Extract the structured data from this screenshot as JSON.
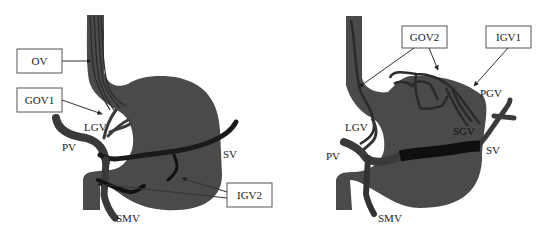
{
  "colors": {
    "organ": "#4a4a4a",
    "vessel": "#333333",
    "vessel_dark": "#111111",
    "box_border": "#555555",
    "text": "#1a1a1a",
    "background": "#ffffff"
  },
  "left_panel": {
    "boxes": [
      {
        "label": "OV"
      },
      {
        "label": "GOV1"
      },
      {
        "label": "IGV2"
      }
    ],
    "labels": {
      "lgv": "LGV",
      "pv": "PV",
      "sv": "SV",
      "smv": "SMV"
    }
  },
  "right_panel": {
    "boxes": [
      {
        "label": "GOV2"
      },
      {
        "label": "IGV1"
      }
    ],
    "labels": {
      "lgv": "LGV",
      "pv": "PV",
      "sv": "SV",
      "smv": "SMV",
      "pgv": "PGV",
      "sgv": "SGV"
    }
  }
}
